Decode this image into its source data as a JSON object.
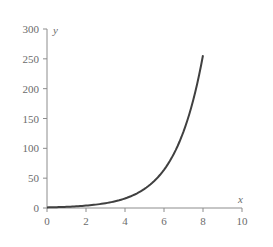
{
  "chart_data": {
    "type": "line",
    "title": "",
    "xlabel": "x",
    "ylabel": "y",
    "xlim": [
      0,
      10
    ],
    "ylim": [
      0,
      300
    ],
    "x_ticks": [
      0,
      2,
      4,
      6,
      8,
      10
    ],
    "y_ticks": [
      0,
      50,
      100,
      150,
      200,
      250,
      300
    ],
    "grid": false,
    "legend": null,
    "series": [
      {
        "name": "y = 2^x",
        "color": "#404040",
        "x": [
          0,
          1,
          2,
          3,
          4,
          5,
          6,
          7,
          8
        ],
        "y": [
          1,
          2,
          4,
          8,
          16,
          32,
          64,
          128,
          256
        ]
      }
    ]
  },
  "axes": {
    "x_label": "x",
    "y_label": "y",
    "x_tick_labels": [
      "0",
      "2",
      "4",
      "6",
      "8",
      "10"
    ],
    "y_tick_labels": [
      "0",
      "50",
      "100",
      "150",
      "200",
      "250",
      "300"
    ]
  },
  "colors": {
    "axis": "#8c8c8c",
    "text": "#6b6b6b",
    "curve": "#404040"
  }
}
